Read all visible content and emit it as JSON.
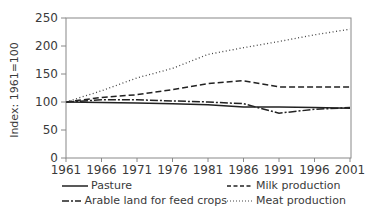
{
  "chart_data": {
    "type": "line",
    "title": "",
    "xlabel": "",
    "ylabel": "Index: 1961=100",
    "x": [
      1961,
      1966,
      1971,
      1976,
      1981,
      1986,
      1991,
      1996,
      2001
    ],
    "x_tick_labels": [
      "1961",
      "1966",
      "1971",
      "1976",
      "1981",
      "1986",
      "1991",
      "1996",
      "2001"
    ],
    "y_ticks": [
      0,
      50,
      100,
      150,
      200,
      250
    ],
    "ylim": [
      0,
      250
    ],
    "grid": false,
    "legend_position": "bottom",
    "series": [
      {
        "name": "Pasture",
        "style": "solid",
        "values": [
          100,
          99,
          98,
          97,
          95,
          91,
          91,
          90,
          89
        ]
      },
      {
        "name": "Milk production",
        "style": "dashed",
        "values": [
          100,
          108,
          113,
          122,
          133,
          138,
          127,
          127,
          127
        ]
      },
      {
        "name": "Arable land for feed crops",
        "style": "dashdot",
        "values": [
          100,
          104,
          104,
          102,
          100,
          97,
          80,
          87,
          90
        ]
      },
      {
        "name": "Meat production",
        "style": "dotted",
        "values": [
          100,
          120,
          143,
          160,
          185,
          197,
          208,
          220,
          230
        ]
      }
    ]
  },
  "legend": {
    "items": [
      {
        "label": "Pasture",
        "style": "solid"
      },
      {
        "label": "Milk production",
        "style": "dashed"
      },
      {
        "label": "Arable land for feed crops",
        "style": "dashdot"
      },
      {
        "label": "Meat production",
        "style": "dotted"
      }
    ]
  }
}
